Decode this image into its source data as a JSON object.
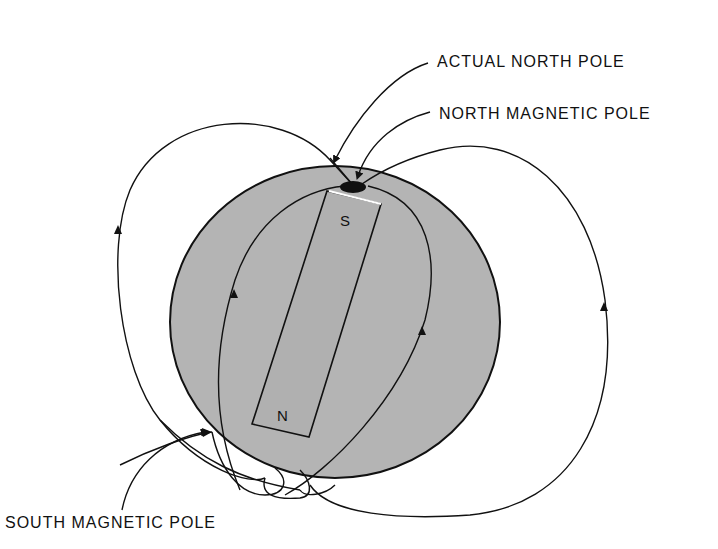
{
  "diagram": {
    "type": "earth-magnetic-field",
    "labels": {
      "actual_north_pole": "ACTUAL NORTH POLE",
      "north_magnetic_pole": "NORTH MAGNETIC POLE",
      "south_magnetic_pole": "SOUTH MAGNETIC POLE"
    },
    "magnet": {
      "top_letter": "S",
      "bottom_letter": "N"
    },
    "colors": {
      "earth_fill": "#b4b4b4",
      "magnet_fill": "#b0b0b0",
      "line": "#111111",
      "background": "#ffffff"
    }
  }
}
